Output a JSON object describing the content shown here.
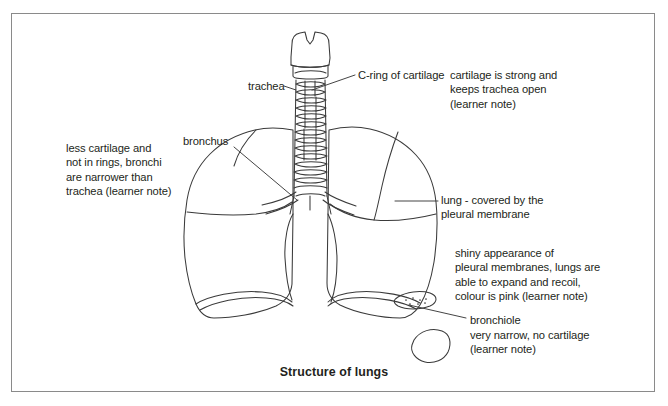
{
  "figure": {
    "caption": "Structure of lungs",
    "border_color": "#8a8a8a",
    "line_color": "#3a3a3a",
    "text_color": "#231f20",
    "background": "#ffffff"
  },
  "labels": {
    "trachea": "trachea",
    "c_ring": "C-ring of cartilage",
    "bronchus": "bronchus",
    "bronchiole": "bronchiole"
  },
  "notes": {
    "cartilage": "cartilage is strong and\nkeeps trachea open\n(learner note)",
    "bronchi": "less cartilage and\nnot in rings, bronchi\nare narrower than\ntrachea (learner note)",
    "lung": "lung - covered by the\npleural membrane",
    "shiny": "shiny appearance of\npleural membranes, lungs are\nable to expand and recoil,\ncolour is pink (learner note)",
    "bronchiole": "very narrow, no cartilage\n(learner note)"
  },
  "parts": [
    {
      "name": "larynx",
      "label": ""
    },
    {
      "name": "trachea",
      "label": "trachea"
    },
    {
      "name": "left-lung",
      "label": "lung"
    },
    {
      "name": "right-lung",
      "label": "lung"
    },
    {
      "name": "bronchus",
      "label": "bronchus"
    },
    {
      "name": "bronchiole-inset",
      "label": "bronchiole"
    }
  ]
}
